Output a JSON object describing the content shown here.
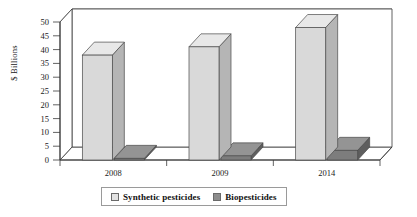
{
  "chart_data": {
    "type": "bar",
    "title": "",
    "subtitle": "",
    "xlabel": "",
    "ylabel": "$ Billions",
    "categories": [
      "2008",
      "2009",
      "2014"
    ],
    "series": [
      {
        "name": "Synthetic pesticides",
        "color": "#d9d9d9",
        "values": [
          38,
          41,
          48
        ]
      },
      {
        "name": "Biopesticides",
        "color": "#808080",
        "values": [
          0.6,
          1.5,
          3.5
        ]
      }
    ],
    "ylim": [
      0,
      50
    ],
    "y_ticks": [
      0,
      5,
      10,
      15,
      20,
      25,
      30,
      35,
      40,
      45,
      50
    ],
    "y_tick_labels": [
      "0",
      "5",
      "10",
      "15",
      "20",
      "25",
      "30",
      "35",
      "40",
      "45",
      "50"
    ],
    "grid": true,
    "grid_axis": "y",
    "legend_position": "bottom",
    "three_d": true
  },
  "axes": {
    "y_title": "$ Billions"
  },
  "legend": {
    "items": [
      {
        "label": "Synthetic pesticides",
        "swatch_name": "legend-swatch-synthetic-pesticides"
      },
      {
        "label": "Biopesticides",
        "swatch_name": "legend-swatch-biopesticides"
      }
    ]
  },
  "colors": {
    "series_light_front": "#d9d9d9",
    "series_light_top": "#e8e8e8",
    "series_light_side": "#b5b5b5",
    "series_dark_front": "#7d7d7d",
    "series_dark_top": "#949494",
    "series_dark_side": "#5e5e5e",
    "grid_line": "#4a4a4a",
    "axis_line": "#3a3a3a",
    "plot_background": "#ffffff",
    "text": "#1a1a1a"
  }
}
